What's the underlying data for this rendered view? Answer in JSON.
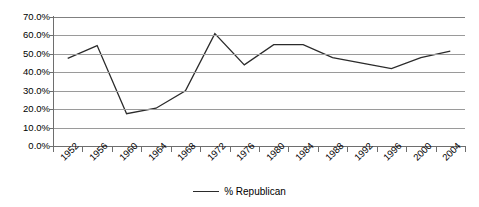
{
  "chart_data": {
    "type": "line",
    "title": "",
    "xlabel": "",
    "ylabel": "",
    "categories": [
      "1952",
      "1956",
      "1960",
      "1964",
      "1968",
      "1972",
      "1976",
      "1980",
      "1984",
      "1988",
      "1992",
      "1996",
      "2000",
      "2004"
    ],
    "series": [
      {
        "name": "% Republican",
        "color": "#2b2b2b",
        "values": [
          47.5,
          54.5,
          17.5,
          20.5,
          30.0,
          61.0,
          44.0,
          55.0,
          55.0,
          48.0,
          45.0,
          42.0,
          48.0,
          51.5
        ]
      }
    ],
    "ylim": [
      0,
      70
    ],
    "ytick_values": [
      0,
      10,
      20,
      30,
      40,
      50,
      60,
      70
    ],
    "ytick_labels": [
      "0.0%",
      "10.0%",
      "20.0%",
      "30.0%",
      "40.0%",
      "50.0%",
      "60.0%",
      "70.0%"
    ],
    "grid": "horizontal",
    "legend_position": "bottom",
    "legend_entries": [
      "% Republican"
    ]
  },
  "legend": {
    "label": "% Republican",
    "swatch_name": "line-swatch"
  }
}
